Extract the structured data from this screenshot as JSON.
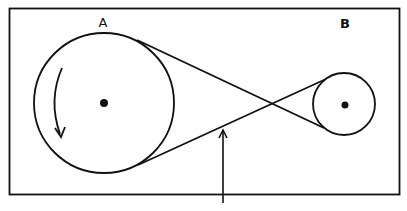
{
  "diagram": {
    "pulleys": [
      {
        "id": "A",
        "label": "A",
        "role": "driver",
        "rotation": "counter-clockwise"
      },
      {
        "id": "B",
        "label": "B",
        "role": "driven"
      }
    ],
    "belt": {
      "type": "crossed"
    },
    "pointer": {
      "target": "belt lower strand"
    },
    "colors": {
      "stroke": "#111111",
      "background": "#ffffff"
    }
  }
}
